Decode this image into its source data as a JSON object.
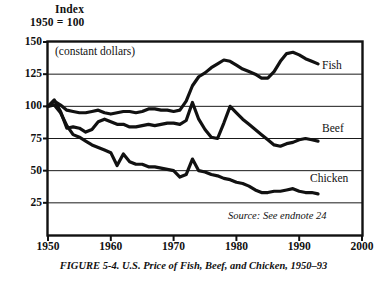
{
  "axis_header": {
    "line1": "Index",
    "line2": "1950 = 100"
  },
  "annotation": "(constant dollars)",
  "source_note": "Source: See endnote 24",
  "caption": "FIGURE 5-4. U.S. Price of Fish, Beef, and Chicken, 1950–93",
  "series_labels": {
    "fish": "Fish",
    "beef": "Beef",
    "chicken": "Chicken"
  },
  "chart_data": {
    "type": "line",
    "title": "U.S. Price of Fish, Beef, and Chicken, 1950–93",
    "subtitle": "(constant dollars)",
    "xlabel": "",
    "ylabel": "Index 1950 = 100",
    "xlim": [
      1950,
      2000
    ],
    "ylim": [
      0,
      150
    ],
    "yticks": [
      25,
      50,
      75,
      100,
      125,
      150
    ],
    "ytick_labels": [
      "25",
      "50",
      "75",
      "100",
      "125",
      "150"
    ],
    "xticks": [
      1950,
      1960,
      1970,
      1980,
      1990,
      2000
    ],
    "xtick_labels": [
      "1950",
      "1960",
      "1970",
      "1980",
      "1990",
      "2000"
    ],
    "grid": "horizontal",
    "legend_position": "inline-right",
    "x": [
      1950,
      1951,
      1952,
      1953,
      1954,
      1955,
      1956,
      1957,
      1958,
      1959,
      1960,
      1961,
      1962,
      1963,
      1964,
      1965,
      1966,
      1967,
      1968,
      1969,
      1970,
      1971,
      1972,
      1973,
      1974,
      1975,
      1976,
      1977,
      1978,
      1979,
      1980,
      1981,
      1982,
      1983,
      1984,
      1985,
      1986,
      1987,
      1988,
      1989,
      1990,
      1991,
      1992,
      1993
    ],
    "series": [
      {
        "name": "Fish",
        "values": [
          100,
          104,
          101,
          97,
          96,
          95,
          95,
          96,
          97,
          95,
          94,
          95,
          96,
          96,
          95,
          96,
          98,
          98,
          97,
          97,
          96,
          97,
          104,
          116,
          123,
          126,
          130,
          133,
          136,
          135,
          132,
          129,
          127,
          125,
          122,
          122,
          127,
          135,
          141,
          142,
          140,
          137,
          135,
          133
        ]
      },
      {
        "name": "Beef",
        "values": [
          100,
          105,
          96,
          83,
          84,
          83,
          80,
          82,
          88,
          90,
          88,
          86,
          86,
          84,
          84,
          85,
          86,
          85,
          86,
          87,
          87,
          86,
          89,
          103,
          90,
          82,
          76,
          75,
          87,
          100,
          95,
          90,
          86,
          82,
          78,
          74,
          70,
          69,
          71,
          72,
          74,
          75,
          74,
          73
        ]
      },
      {
        "name": "Chicken",
        "values": [
          100,
          101,
          95,
          85,
          78,
          76,
          73,
          70,
          68,
          66,
          64,
          54,
          63,
          57,
          55,
          55,
          53,
          53,
          52,
          51,
          50,
          45,
          47,
          59,
          50,
          49,
          47,
          46,
          44,
          43,
          41,
          40,
          38,
          35,
          33,
          33,
          34,
          34,
          35,
          36,
          34,
          33,
          33,
          32
        ]
      }
    ]
  }
}
